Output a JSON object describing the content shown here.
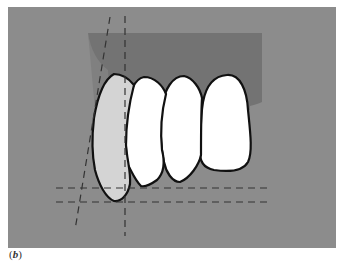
{
  "figure": {
    "label": "(b)",
    "label_letter": "b",
    "colors": {
      "background": "#8c8c8c",
      "gum": "#737373",
      "tooth_highlighted": "#d4d4d4",
      "tooth": "#ffffff",
      "outline": "#111111",
      "guide_lines": "#333333"
    },
    "teeth": [
      {
        "name": "canine",
        "highlighted": true
      },
      {
        "name": "lateral-incisor-1",
        "highlighted": false
      },
      {
        "name": "central-incisor-1",
        "highlighted": false
      },
      {
        "name": "lateral-incisor-2",
        "highlighted": false
      }
    ],
    "guide_lines": [
      {
        "name": "vertical-line",
        "orientation": "vertical"
      },
      {
        "name": "oblique-line",
        "orientation": "oblique"
      },
      {
        "name": "horizontal-line-upper",
        "orientation": "horizontal"
      },
      {
        "name": "horizontal-line-lower",
        "orientation": "horizontal"
      }
    ]
  }
}
